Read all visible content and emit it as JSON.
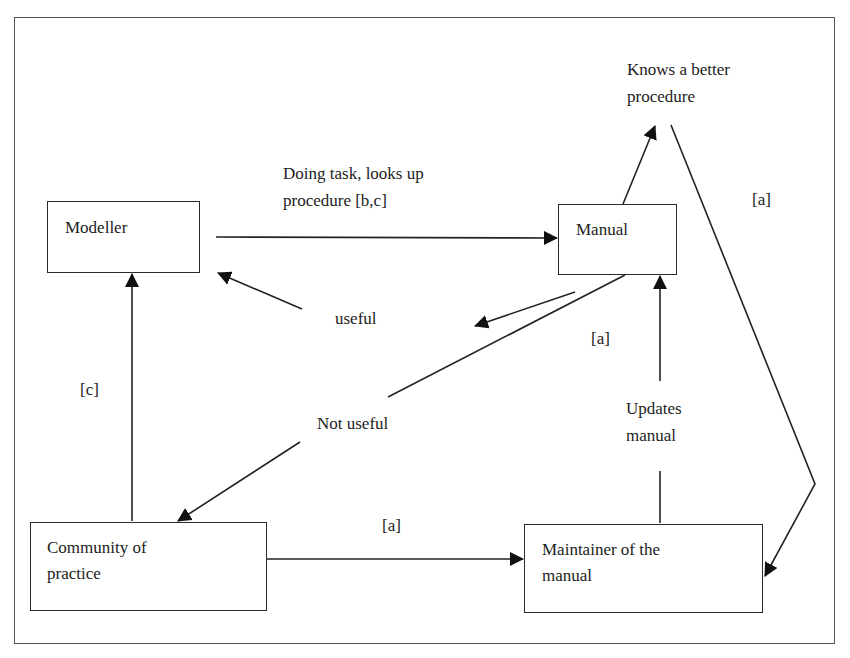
{
  "diagram": {
    "nodes": {
      "modeller": "Modeller",
      "manual": "Manual",
      "community": "Community of\npractice",
      "maintainer": "Maintainer of the\nmanual"
    },
    "labels": {
      "doing_task": "Doing task, looks up\nprocedure [b,c]",
      "knows_better": "Knows a better\nprocedure",
      "a_right": "[a]",
      "useful": "useful",
      "a_middle": "[a]",
      "c_left": "[c]",
      "not_useful": "Not useful",
      "updates_manual": "Updates\nmanual",
      "a_bottom": "[a]"
    },
    "edges": [
      {
        "from": "Modeller",
        "to": "Manual",
        "label": "Doing task, looks up procedure [b,c]"
      },
      {
        "from": "Manual",
        "to": "Knows a better procedure",
        "label": ""
      },
      {
        "from": "Knows a better procedure",
        "to": "Maintainer of the manual",
        "label": "[a]"
      },
      {
        "from": "Manual",
        "to": "Modeller",
        "label": "useful"
      },
      {
        "from": "Manual",
        "to": "Community of practice",
        "label": "Not useful"
      },
      {
        "from": "Community of practice",
        "to": "Modeller",
        "label": "[c]"
      },
      {
        "from": "Community of practice",
        "to": "Maintainer of the manual",
        "label": "[a]"
      },
      {
        "from": "Maintainer of the manual",
        "to": "Manual",
        "label": "Updates manual [a]"
      }
    ],
    "colors": {
      "stroke": "#222222",
      "background": "#ffffff"
    }
  }
}
